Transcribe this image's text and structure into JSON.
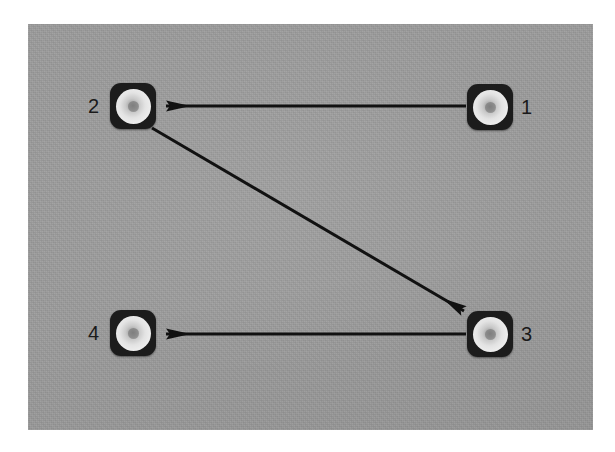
{
  "figure": {
    "canvas": {
      "width": 615,
      "height": 452,
      "background": "#ffffff"
    },
    "panel": {
      "x": 28,
      "y": 24,
      "width": 565,
      "height": 406,
      "color": "#9b9b9b",
      "description": "photographic gray background plate"
    }
  },
  "nodes": [
    {
      "id": "node-1",
      "label": "1",
      "x": 467,
      "y": 84,
      "size": 46,
      "label_side": "right",
      "label_x": 521,
      "label_y": 97,
      "body_color": "#1c1c1c",
      "disc_color": "#e3e3e3",
      "dot_color": "#8d8d8d"
    },
    {
      "id": "node-2",
      "label": "2",
      "x": 110,
      "y": 83,
      "size": 46,
      "label_side": "left",
      "label_x": 88,
      "label_y": 96,
      "body_color": "#1c1c1c",
      "disc_color": "#e3e3e3",
      "dot_color": "#8d8d8d"
    },
    {
      "id": "node-3",
      "label": "3",
      "x": 467,
      "y": 311,
      "size": 46,
      "label_side": "right",
      "label_x": 521,
      "label_y": 324,
      "body_color": "#1c1c1c",
      "disc_color": "#e3e3e3",
      "dot_color": "#8d8d8d"
    },
    {
      "id": "node-4",
      "label": "4",
      "x": 110,
      "y": 310,
      "size": 46,
      "label_side": "left",
      "label_x": 88,
      "label_y": 323,
      "body_color": "#1c1c1c",
      "disc_color": "#e3e3e3",
      "dot_color": "#8d8d8d"
    }
  ],
  "arrows": [
    {
      "id": "arrow-1-to-2",
      "from": "node-1",
      "to": "node-2",
      "direction": "leftward-horizontal",
      "x1": 466,
      "y1": 106,
      "x2": 163,
      "y2": 106,
      "color": "#111111",
      "width": 3
    },
    {
      "id": "arrow-2-to-3",
      "from": "node-2",
      "to": "node-3",
      "direction": "diagonal-down-right",
      "x1": 152,
      "y1": 128,
      "x2": 466,
      "y2": 312,
      "color": "#111111",
      "width": 3
    },
    {
      "id": "arrow-3-to-4",
      "from": "node-3",
      "to": "node-4",
      "direction": "leftward-horizontal",
      "x1": 466,
      "y1": 334,
      "x2": 163,
      "y2": 334,
      "color": "#111111",
      "width": 3
    }
  ]
}
